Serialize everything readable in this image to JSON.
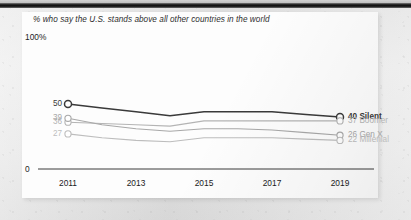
{
  "chart_data": {
    "type": "line",
    "title": "",
    "subtitle": "% who say the U.S. stands above all other countries in the world",
    "xlabel": "",
    "ylabel": "",
    "ylim": [
      0,
      100
    ],
    "ylim_top_label": "100%",
    "ylim_zero_label": "0",
    "grid": false,
    "legend_position": "right-inline",
    "x": [
      2011,
      2012,
      2013,
      2014,
      2015,
      2016,
      2017,
      2018,
      2019
    ],
    "xticks": [
      "2011",
      "2013",
      "2015",
      "2017",
      "2019"
    ],
    "xtick_values": [
      2011,
      2013,
      2015,
      2017,
      2019
    ],
    "series": [
      {
        "name": "Silent",
        "color": "#3a3a3a",
        "start_label": "50",
        "end_label": "40 Silent",
        "start_value": 50,
        "end_value": 40,
        "values": [
          50,
          47,
          44,
          41,
          44,
          44,
          44,
          42,
          40
        ]
      },
      {
        "name": "Boomer",
        "color": "#b4b4b4",
        "start_label": "36",
        "end_label": "37 Boomer",
        "start_value": 36,
        "end_value": 37,
        "values": [
          36,
          35,
          34,
          33,
          37,
          37,
          37,
          37,
          37
        ]
      },
      {
        "name": "Gen X",
        "color": "#a8a8a8",
        "start_label": "39",
        "end_label": "26 Gen X",
        "start_value": 39,
        "end_value": 26,
        "values": [
          39,
          34,
          31,
          29,
          31,
          31,
          30,
          28,
          26
        ]
      },
      {
        "name": "Millenial",
        "color": "#bdbdbd",
        "start_label": "27",
        "end_label": "22 Millenial",
        "start_value": 27,
        "end_value": 22,
        "values": [
          27,
          24,
          22,
          21,
          24,
          24,
          24,
          23,
          22
        ]
      }
    ]
  }
}
